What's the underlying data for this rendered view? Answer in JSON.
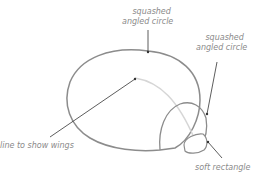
{
  "diagram": {
    "labels": [
      {
        "id": "body",
        "text_line1": "squashed",
        "text_line2": "angled circle"
      },
      {
        "id": "head",
        "text_line1": "squashed",
        "text_line2": "angled circle"
      },
      {
        "id": "wings",
        "text": "line to show wings"
      },
      {
        "id": "beak",
        "text": "soft rectangle"
      }
    ],
    "colors": {
      "stroke": "#8c8c8c",
      "light_stroke": "#d6d6d6",
      "text": "#8a8a8a",
      "leader": "#333333"
    }
  }
}
